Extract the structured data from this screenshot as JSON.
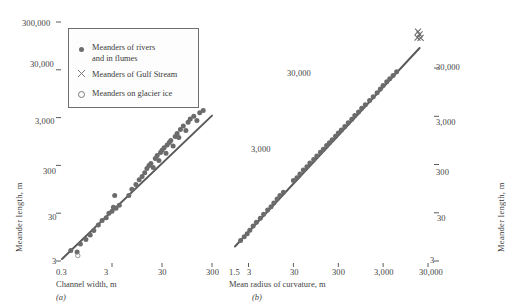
{
  "figure": {
    "background": "#ffffff",
    "ink_color": "#4a4a4a",
    "marker_color": "#6b6b6b",
    "line_color": "#5a5a5a"
  },
  "legend": {
    "items": [
      {
        "marker": "filled-circle-icon",
        "label_line1": "Meanders of rivers",
        "label_line2": "and in flumes"
      },
      {
        "marker": "cross-x-icon",
        "label_line1": "Meanders of Gulf Stream",
        "label_line2": ""
      },
      {
        "marker": "open-circle-icon",
        "label_line1": "Meanders on glacier ice",
        "label_line2": ""
      }
    ]
  },
  "panel_a": {
    "label": "(a)",
    "xlabel": "Channel width, m",
    "ylabel": "Meander length, m",
    "xticks": [
      "0.3",
      "3",
      "30",
      "300"
    ],
    "yticks": [
      "3",
      "30",
      "300",
      "3,000",
      "30,000",
      "300,000"
    ]
  },
  "panel_b": {
    "label": "(b)",
    "xlabel": "Mean radius of curvature, m",
    "ylabel": "Meander length, m",
    "xticks": [
      "1.5",
      "3",
      "30",
      "300",
      "3,000",
      "30,000"
    ],
    "yticks": [
      "3",
      "30",
      "300",
      "3,000",
      "30,000"
    ],
    "inner_labels": [
      "3,000",
      "30,000"
    ]
  },
  "chart_data": {
    "type": "scatter",
    "title": "",
    "panels": [
      {
        "id": "a",
        "label": "(a)",
        "xlabel": "Channel width, m",
        "ylabel": "Meander length, m",
        "xscale": "log",
        "yscale": "log",
        "xlim": [
          0.3,
          300
        ],
        "ylim": [
          3,
          300000
        ],
        "xticks": [
          0.3,
          3,
          30,
          300
        ],
        "xticklabels": [
          "0.3",
          "3",
          "30",
          "300"
        ],
        "yticks": [
          3,
          30,
          300,
          3000,
          30000,
          300000
        ],
        "yticklabels": [
          "3",
          "30",
          "300",
          "3,000",
          "30,000",
          "300,000"
        ],
        "grid": false,
        "fit_line": {
          "x": [
            0.3,
            300
          ],
          "y": [
            3.3,
            3300
          ],
          "note": "meander length proportional to channel width, slope 1 on log-log"
        },
        "series": [
          {
            "name": "Meanders of rivers and in flumes",
            "marker": "filled-circle",
            "points": [
              [
                0.45,
                5.0
              ],
              [
                0.6,
                4.6
              ],
              [
                0.7,
                6.8
              ],
              [
                0.9,
                8.5
              ],
              [
                1.1,
                10.5
              ],
              [
                1.3,
                13.0
              ],
              [
                1.6,
                17.0
              ],
              [
                1.9,
                21.0
              ],
              [
                2.3,
                24.0
              ],
              [
                2.6,
                30.0
              ],
              [
                3.0,
                33.0
              ],
              [
                3.2,
                40.0
              ],
              [
                3.4,
                70.0
              ],
              [
                3.6,
                38.0
              ],
              [
                4.2,
                44.0
              ],
              [
                6.5,
                70.0
              ],
              [
                7.5,
                95.0
              ],
              [
                9.0,
                120.0
              ],
              [
                10.5,
                150.0
              ],
              [
                12.0,
                175.0
              ],
              [
                13.5,
                210.0
              ],
              [
                15.0,
                260.0
              ],
              [
                16.5,
                300.0
              ],
              [
                18.0,
                330.0
              ],
              [
                20.0,
                270.0
              ],
              [
                22.0,
                420.0
              ],
              [
                24.0,
                480.0
              ],
              [
                26.0,
                380.0
              ],
              [
                28.0,
                560.0
              ],
              [
                30.0,
                620.0
              ],
              [
                33.0,
                700.0
              ],
              [
                36.0,
                540.0
              ],
              [
                38.0,
                800.0
              ],
              [
                42.0,
                900.0
              ],
              [
                45.0,
                1000.0
              ],
              [
                50.0,
                760.0
              ],
              [
                55.0,
                1200.0
              ],
              [
                60.0,
                1400.0
              ],
              [
                65.0,
                1150.0
              ],
              [
                70.0,
                1700.0
              ],
              [
                80.0,
                2000.0
              ],
              [
                90.0,
                1600.0
              ],
              [
                100.0,
                2400.0
              ],
              [
                110.0,
                2800.0
              ],
              [
                130.0,
                3200.0
              ],
              [
                150.0,
                2600.0
              ],
              [
                170.0,
                3800.0
              ],
              [
                200.0,
                4200.0
              ]
            ]
          },
          {
            "name": "Meanders on glacier ice",
            "marker": "open-circle",
            "points": [
              [
                0.62,
                3.9
              ]
            ]
          }
        ]
      },
      {
        "id": "b",
        "label": "(b)",
        "xlabel": "Mean radius of curvature, m",
        "ylabel": "Meander length, m",
        "xscale": "log",
        "yscale": "log",
        "xlim": [
          1.5,
          30000
        ],
        "ylim": [
          3,
          30000
        ],
        "xticks": [
          1.5,
          3,
          30,
          300,
          3000,
          30000
        ],
        "xticklabels": [
          "1.5",
          "3",
          "30",
          "300",
          "3,000",
          "30,000"
        ],
        "yticks": [
          3,
          30,
          300,
          3000,
          30000
        ],
        "yticklabels": [
          "3",
          "30",
          "300",
          "3,000",
          "30,000"
        ],
        "grid": false,
        "fit_line": {
          "x": [
            1.5,
            30000
          ],
          "y": [
            6.0,
            120000
          ],
          "note": "meander length about 4.7 times mean radius of curvature"
        },
        "series": [
          {
            "name": "Meanders of rivers and in flumes",
            "marker": "filled-circle",
            "points": [
              [
                2.0,
                8.0
              ],
              [
                2.4,
                9.5
              ],
              [
                2.8,
                11.0
              ],
              [
                3.2,
                13.0
              ],
              [
                3.8,
                16.0
              ],
              [
                4.5,
                19.0
              ],
              [
                5.5,
                23.0
              ],
              [
                6.5,
                28.0
              ],
              [
                8.0,
                34.0
              ],
              [
                9.5,
                40.0
              ],
              [
                11.0,
                48.0
              ],
              [
                13.0,
                58.0
              ],
              [
                15.0,
                68.0
              ],
              [
                18.0,
                80.0
              ],
              [
                30.0,
                140.0
              ],
              [
                36.0,
                160.0
              ],
              [
                42.0,
                190.0
              ],
              [
                50.0,
                230.0
              ],
              [
                60.0,
                270.0
              ],
              [
                70.0,
                320.0
              ],
              [
                85.0,
                380.0
              ],
              [
                100.0,
                450.0
              ],
              [
                120.0,
                540.0
              ],
              [
                140.0,
                620.0
              ],
              [
                165.0,
                740.0
              ],
              [
                190.0,
                850.0
              ],
              [
                220.0,
                980.0
              ],
              [
                260.0,
                1150.0
              ],
              [
                300.0,
                1350.0
              ],
              [
                350.0,
                1550.0
              ],
              [
                420.0,
                1850.0
              ],
              [
                500.0,
                2200.0
              ],
              [
                600.0,
                2600.0
              ],
              [
                700.0,
                3100.0
              ],
              [
                850.0,
                3700.0
              ],
              [
                1000.0,
                4400.0
              ],
              [
                1200.0,
                5200.0
              ],
              [
                1500.0,
                6400.0
              ],
              [
                1800.0,
                7600.0
              ],
              [
                2200.0,
                9200.0
              ],
              [
                2600.0,
                11000.0
              ],
              [
                3000.0,
                13000.0
              ],
              [
                3600.0,
                15500.0
              ],
              [
                4200.0,
                18000.0
              ],
              [
                5000.0,
                21000.0
              ],
              [
                6000.0,
                25000.0
              ]
            ]
          },
          {
            "name": "Meanders of Gulf Stream",
            "marker": "cross-x",
            "points": [
              [
                18000.0,
                170000.0
              ],
              [
                19500.0,
                150000.0
              ],
              [
                17500.0,
                128000.0
              ],
              [
                20500.0,
                126000.0
              ]
            ]
          }
        ]
      }
    ]
  }
}
